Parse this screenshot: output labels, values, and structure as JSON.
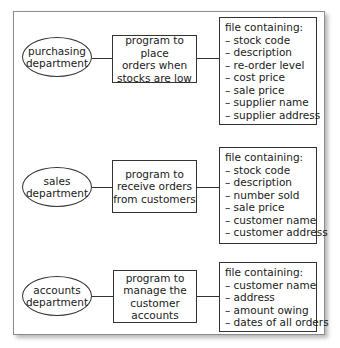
{
  "diagram": {
    "rows": [
      {
        "department": [
          "purchasing",
          "department"
        ],
        "program": [
          "program to place",
          "orders when",
          "stocks are low"
        ],
        "file_title": "file containing:",
        "file_items": [
          "stock code",
          "description",
          "re-order level",
          "cost price",
          "sale price",
          "supplier name",
          "supplier address"
        ]
      },
      {
        "department": [
          "sales",
          "department"
        ],
        "program": [
          "program to",
          "receive orders",
          "from customers"
        ],
        "file_title": "file containing:",
        "file_items": [
          "stock code",
          "description",
          "number sold",
          "sale price",
          "customer name",
          "customer address"
        ]
      },
      {
        "department": [
          "accounts",
          "department"
        ],
        "program": [
          "program to",
          "manage the",
          "customer",
          "accounts"
        ],
        "file_title": "file containing:",
        "file_items": [
          "customer name",
          "address",
          "amount owing",
          "dates of all orders"
        ]
      }
    ],
    "bullet": "– "
  }
}
